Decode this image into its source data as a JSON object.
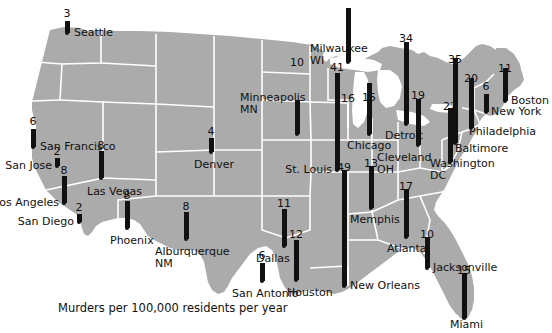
{
  "figure": {
    "caption": "Murders per 100,000 residents per year",
    "credit": "© Cengage Learning 2013.",
    "map_fill": "#ababab",
    "border_color": "#ffffff",
    "bar_color": "#111111",
    "background": "#ffffff"
  },
  "chart_data": {
    "type": "bar",
    "title": "Murders per 100,000 residents per year",
    "xlabel": "",
    "ylabel": "Murders per 100,000 residents per year",
    "grid": false,
    "legend": null,
    "units": "murders per 100,000 residents per year",
    "value_range": [
      2,
      49
    ],
    "categories": [
      "Seattle",
      "San Francisco",
      "San Jose",
      "Los Angeles",
      "San Diego",
      "Las Vegas",
      "Phoenix",
      "Denver",
      "Alburquerque, NM",
      "Dallas",
      "San Antonio",
      "Houston",
      "Minneapolis, MN",
      "Milwaukee, WI",
      "Chicago",
      "St. Louis",
      "Detroit",
      "Cleveland, OH",
      "Memphis",
      "New Orleans",
      "Atlanta",
      "Jacksonville",
      "Miami",
      "Washington, DC",
      "Baltimore",
      "Philadelphia",
      "New York",
      "Boston"
    ],
    "values": [
      3,
      6,
      2,
      8,
      2,
      8,
      8,
      4,
      8,
      11,
      6,
      12,
      10,
      16,
      15,
      41,
      34,
      19,
      13,
      49,
      17,
      10,
      15,
      22,
      35,
      20,
      6,
      11
    ],
    "points": [
      {
        "city": "Seattle",
        "value": 3,
        "dot_x": 67,
        "dot_y": 33,
        "bar_h": 12,
        "label_x": 74,
        "label_y": 27,
        "label_align": "left",
        "val_x": 67,
        "val_y": 8
      },
      {
        "city": "San Francisco",
        "value": 6,
        "dot_x": 33,
        "dot_y": 147,
        "bar_h": 18,
        "label_x": 40,
        "label_y": 141,
        "label_align": "left",
        "val_x": 33,
        "val_y": 116
      },
      {
        "city": "San Jose",
        "value": 2,
        "dot_x": 57,
        "dot_y": 166,
        "bar_h": 8,
        "label_x": 52,
        "label_y": 160,
        "label_align": "right",
        "val_x": 57,
        "val_y": 146
      },
      {
        "city": "Los Angeles",
        "value": 8,
        "dot_x": 64,
        "dot_y": 203,
        "bar_h": 27,
        "label_x": 59,
        "label_y": 197,
        "label_align": "right",
        "val_x": 64,
        "val_y": 165
      },
      {
        "city": "San Diego",
        "value": 2,
        "dot_x": 79,
        "dot_y": 222,
        "bar_h": 8,
        "label_x": 74,
        "label_y": 216,
        "label_align": "right",
        "val_x": 79,
        "val_y": 202
      },
      {
        "city": "Las Vegas",
        "value": 8,
        "dot_x": 101,
        "dot_y": 178,
        "bar_h": 27,
        "label_x": 87,
        "label_y": 186,
        "label_align": "left",
        "val_x": 101,
        "val_y": 140
      },
      {
        "city": "Phoenix",
        "value": 8,
        "dot_x": 127,
        "dot_y": 228,
        "bar_h": 27,
        "label_x": 110,
        "label_y": 235,
        "label_align": "left",
        "val_x": 127,
        "val_y": 190
      },
      {
        "city": "Denver",
        "value": 4,
        "dot_x": 211,
        "dot_y": 152,
        "bar_h": 14,
        "label_x": 194,
        "label_y": 159,
        "label_align": "left",
        "val_x": 211,
        "val_y": 126
      },
      {
        "city": "Alburquerque, NM",
        "value": 8,
        "dot_x": 186,
        "dot_y": 239,
        "bar_h": 27,
        "label_x": 155,
        "label_y": 246,
        "label_align": "left",
        "val_x": 186,
        "val_y": 201
      },
      {
        "city": "Dallas",
        "value": 11,
        "dot_x": 284,
        "dot_y": 246,
        "bar_h": 37,
        "label_x": 256,
        "label_y": 253,
        "label_align": "left",
        "val_x": 284,
        "val_y": 198
      },
      {
        "city": "San Antonio",
        "value": 6,
        "dot_x": 262,
        "dot_y": 281,
        "bar_h": 18,
        "label_x": 232,
        "label_y": 288,
        "label_align": "left",
        "val_x": 262,
        "val_y": 250
      },
      {
        "city": "San Antonio2",
        "value": 0,
        "dot_x": 0,
        "dot_y": 0,
        "bar_h": 0,
        "label_x": 0,
        "label_y": 0,
        "label_align": "left",
        "val_x": 0,
        "val_y": 0
      },
      {
        "city": "Houston",
        "value": 12,
        "dot_x": 296,
        "dot_y": 280,
        "bar_h": 40,
        "label_x": 287,
        "label_y": 287,
        "label_align": "left",
        "val_x": 296,
        "val_y": 229
      },
      {
        "city": "Minneapolis, MN",
        "value": 10,
        "dot_x": 297,
        "dot_y": 134,
        "bar_h": 34,
        "label_x": 240,
        "label_y": 92,
        "label_align": "left",
        "val_x": 297,
        "val_y": 57
      },
      {
        "city": "Milwaukee, WI",
        "value": 16,
        "dot_x": 348,
        "dot_y": 62,
        "bar_h": 54,
        "label_x": 310,
        "label_y": 43,
        "label_align": "left",
        "val_x": 348,
        "val_y": 93
      },
      {
        "city": "Chicago",
        "value": 15,
        "dot_x": 369,
        "dot_y": 134,
        "bar_h": 51,
        "label_x": 347,
        "label_y": 140,
        "label_align": "left",
        "val_x": 369,
        "val_y": 92
      },
      {
        "city": "St. Louis",
        "value": 41,
        "dot_x": 337,
        "dot_y": 170,
        "bar_h": 97,
        "label_x": 332,
        "label_y": 164,
        "label_align": "right",
        "val_x": 337,
        "val_y": 62
      },
      {
        "city": "Detroit",
        "value": 34,
        "dot_x": 406,
        "dot_y": 124,
        "bar_h": 82,
        "label_x": 385,
        "label_y": 130,
        "label_align": "left",
        "val_x": 406,
        "val_y": 33
      },
      {
        "city": "Cleveland, OH",
        "value": 19,
        "dot_x": 418,
        "dot_y": 145,
        "bar_h": 46,
        "label_x": 377,
        "label_y": 152,
        "label_align": "left",
        "val_x": 418,
        "val_y": 90
      },
      {
        "city": "Memphis",
        "value": 13,
        "dot_x": 371,
        "dot_y": 208,
        "bar_h": 42,
        "label_x": 350,
        "label_y": 214,
        "label_align": "left",
        "val_x": 371,
        "val_y": 158
      },
      {
        "city": "New Orleans",
        "value": 49,
        "dot_x": 344,
        "dot_y": 286,
        "bar_h": 116,
        "label_x": 350,
        "label_y": 280,
        "label_align": "left",
        "val_x": 344,
        "val_y": 162
      },
      {
        "city": "Atlanta",
        "value": 17,
        "dot_x": 406,
        "dot_y": 237,
        "bar_h": 48,
        "label_x": 387,
        "label_y": 243,
        "label_align": "left",
        "val_x": 406,
        "val_y": 181
      },
      {
        "city": "Jacksonville",
        "value": 10,
        "dot_x": 427,
        "dot_y": 268,
        "bar_h": 31,
        "label_x": 433,
        "label_y": 262,
        "label_align": "left",
        "val_x": 427,
        "val_y": 229
      },
      {
        "city": "Miami",
        "value": 15,
        "dot_x": 464,
        "dot_y": 318,
        "bar_h": 45,
        "label_x": 450,
        "label_y": 319,
        "label_align": "left",
        "val_x": 464,
        "val_y": 265
      },
      {
        "city": "Washington, DC",
        "value": 22,
        "dot_x": 450,
        "dot_y": 162,
        "bar_h": 54,
        "label_x": 430,
        "label_y": 158,
        "label_align": "left",
        "val_x": 450,
        "val_y": 101
      },
      {
        "city": "Baltimore",
        "value": 35,
        "dot_x": 455,
        "dot_y": 143,
        "bar_h": 85,
        "label_x": 455,
        "label_y": 143,
        "label_align": "left",
        "val_x": 455,
        "val_y": 54
      },
      {
        "city": "Philadelphia",
        "value": 20,
        "dot_x": 471,
        "dot_y": 128,
        "bar_h": 50,
        "label_x": 469,
        "label_y": 126,
        "label_align": "left",
        "val_x": 471,
        "val_y": 73
      },
      {
        "city": "New York",
        "value": 6,
        "dot_x": 486,
        "dot_y": 112,
        "bar_h": 18,
        "label_x": 491,
        "label_y": 106,
        "label_align": "left",
        "val_x": 486,
        "val_y": 81
      },
      {
        "city": "Boston",
        "value": 11,
        "dot_x": 505,
        "dot_y": 101,
        "bar_h": 33,
        "label_x": 511,
        "label_y": 95,
        "label_align": "left",
        "val_x": 505,
        "val_y": 63
      }
    ]
  },
  "cities": [
    {
      "name": "Seattle",
      "value": "3"
    },
    {
      "name": "San Francisco",
      "value": "6"
    },
    {
      "name": "San Jose",
      "value": "2"
    },
    {
      "name": "Los Angeles",
      "value": "8"
    },
    {
      "name": "San Diego",
      "value": "2"
    },
    {
      "name": "Las Vegas",
      "value": "8"
    },
    {
      "name": "Phoenix",
      "value": "8"
    },
    {
      "name": "Denver",
      "value": "4"
    },
    {
      "name": "Alburquerque, NM",
      "value": "8"
    },
    {
      "name": "Dallas",
      "value": "11"
    },
    {
      "name": "San Antonio",
      "value": "6"
    },
    {
      "name": "Houston",
      "value": "12"
    },
    {
      "name": "Minneapolis, MN",
      "value": "10"
    },
    {
      "name": "Milwaukee, WI",
      "value": "16"
    },
    {
      "name": "Chicago",
      "value": "15"
    },
    {
      "name": "St. Louis",
      "value": "41"
    },
    {
      "name": "Detroit",
      "value": "34"
    },
    {
      "name": "Cleveland, OH",
      "value": "19"
    },
    {
      "name": "Memphis",
      "value": "13"
    },
    {
      "name": "New Orleans",
      "value": "49"
    },
    {
      "name": "Atlanta",
      "value": "17"
    },
    {
      "name": "Jacksonville",
      "value": "10"
    },
    {
      "name": "Miami",
      "value": "15"
    },
    {
      "name": "Washington, DC",
      "value": "22"
    },
    {
      "name": "Baltimore",
      "value": "35"
    },
    {
      "name": "Philadelphia",
      "value": "20"
    },
    {
      "name": "New York",
      "value": "6"
    },
    {
      "name": "Boston",
      "value": "11"
    }
  ]
}
